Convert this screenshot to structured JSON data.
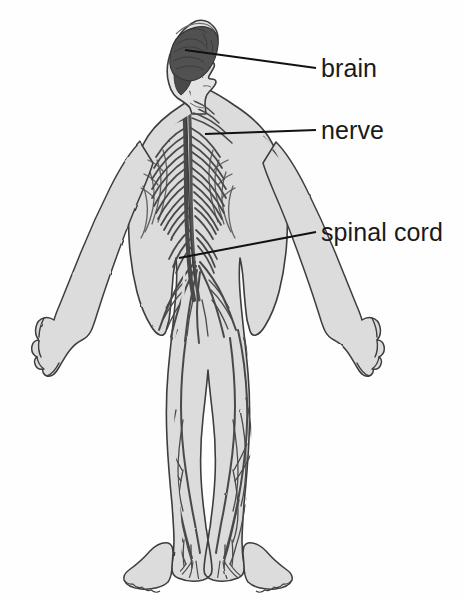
{
  "diagram": {
    "background_color": "#fefefe",
    "body_fill_color": "#dcdcdc",
    "body_outline_color": "#3a3a3a",
    "nerve_color": "#4a4a4a",
    "brain_fill_color": "#4f4f4f",
    "label_color": "#1a1a1a",
    "leader_line_color": "#111111"
  },
  "labels": [
    {
      "id": "brain",
      "text": "brain",
      "x": 321,
      "y": 56,
      "leader": {
        "x1": 185,
        "y1": 50,
        "x2": 316,
        "y2": 68
      }
    },
    {
      "id": "nerve",
      "text": "nerve",
      "x": 321,
      "y": 118,
      "leader": {
        "x1": 205,
        "y1": 134,
        "x2": 316,
        "y2": 130
      }
    },
    {
      "id": "spinal_cord",
      "text": "spinal cord",
      "x": 321,
      "y": 220,
      "leader": {
        "x1": 179,
        "y1": 258,
        "x2": 316,
        "y2": 232
      }
    }
  ],
  "figure": {
    "parts": [
      "brain",
      "spinal cord",
      "cranial nerves",
      "cervical nerves",
      "thoracic nerves",
      "lumbar nerves",
      "sacral plexus",
      "brachial plexus",
      "arm nerves",
      "leg nerves"
    ]
  }
}
